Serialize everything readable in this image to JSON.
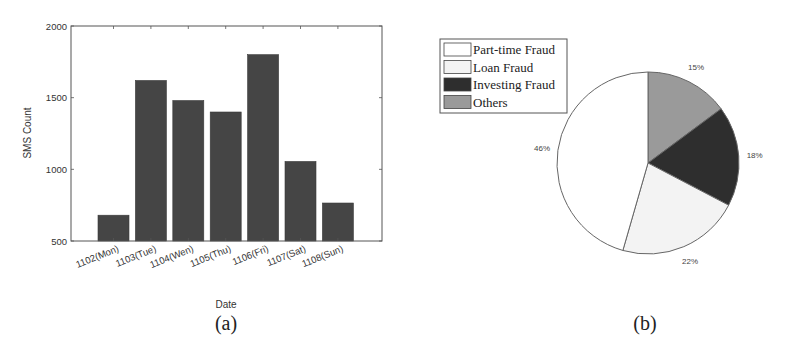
{
  "chart_data": [
    {
      "type": "bar",
      "title": "",
      "caption": "(a)",
      "xlabel": "Date",
      "ylabel": "SMS Count",
      "categories": [
        "1102(Mon)",
        "1103(Tue)",
        "1104(Wen)",
        "1105(Thu)",
        "1106(Fri)",
        "1107(Sat)",
        "1108(Sun)"
      ],
      "values": [
        680,
        1620,
        1480,
        1400,
        1800,
        1055,
        765
      ],
      "ylim": [
        500,
        2000
      ],
      "yticks": [
        "500",
        "1000",
        "1500",
        "2000"
      ],
      "bar_color": "#454545",
      "grid": false,
      "legend": null
    },
    {
      "type": "pie",
      "title": "",
      "caption": "(b)",
      "labels": [
        "Part-time Fraud",
        "Loan Fraud",
        "Investing Fraud",
        "Others"
      ],
      "values": [
        46,
        22,
        18,
        15
      ],
      "value_labels": [
        "46%",
        "22%",
        "18%",
        "15%"
      ],
      "colors": [
        "#ffffff",
        "#f3f3f3",
        "#2e2e2e",
        "#9a9a9a"
      ],
      "legend_position": "upper left"
    }
  ]
}
